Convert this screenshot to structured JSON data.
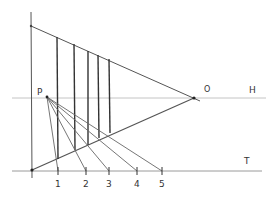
{
  "labels": {
    "horizon": "H",
    "ground": "T",
    "vanishing_point": "O",
    "point": "P",
    "ticks": [
      "1",
      "2",
      "3",
      "4",
      "5"
    ]
  },
  "colors": {
    "ink": "#3a3a3a",
    "faint": "#b8b8b8",
    "background": "#ffffff"
  }
}
